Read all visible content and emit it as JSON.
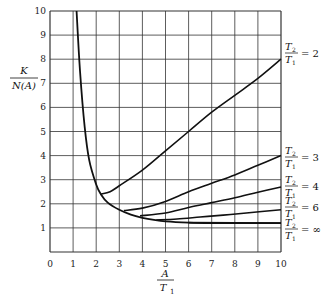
{
  "chart_data": {
    "type": "line",
    "title": "",
    "xlabel": "A / T1",
    "ylabel": "K / N(A)",
    "xlim": [
      0,
      10
    ],
    "ylim": [
      0,
      10
    ],
    "grid": true,
    "xticks": [
      "0",
      "1",
      "2",
      "3",
      "4",
      "5",
      "6",
      "7",
      "8",
      "9",
      "10"
    ],
    "yticks": [
      "1",
      "2",
      "3",
      "4",
      "5",
      "6",
      "7",
      "8",
      "9",
      "10"
    ],
    "legend_position": "right, inline labels at curve ends",
    "envelope": {
      "name": "T2/T1 = inf envelope (steep branch)",
      "x": [
        1.15,
        1.3,
        1.5,
        1.7,
        2.0,
        2.2,
        2.5,
        3.0,
        3.5,
        4.0,
        4.5,
        5.0,
        6.0,
        7.0,
        8.0,
        9.0,
        10.0
      ],
      "y": [
        10.0,
        7.5,
        5.2,
        3.8,
        2.8,
        2.4,
        2.05,
        1.75,
        1.55,
        1.42,
        1.33,
        1.27,
        1.22,
        1.2,
        1.2,
        1.2,
        1.2
      ]
    },
    "series": [
      {
        "name": "T2/T1 = 2",
        "label_num": "T",
        "label_sub_num": "2",
        "label_den": "T",
        "label_sub_den": "1",
        "label_value": "= 2",
        "x": [
          2.2,
          2.6,
          3.0,
          4.0,
          5.0,
          6.0,
          7.0,
          8.0,
          9.0,
          10.0
        ],
        "y": [
          2.4,
          2.5,
          2.75,
          3.4,
          4.2,
          5.0,
          5.8,
          6.5,
          7.2,
          8.0
        ]
      },
      {
        "name": "T2/T1 = 3",
        "label_value": "= 3",
        "x": [
          3.2,
          4.0,
          5.0,
          6.0,
          7.0,
          8.0,
          9.0,
          10.0
        ],
        "y": [
          1.72,
          1.82,
          2.1,
          2.5,
          2.85,
          3.2,
          3.6,
          4.0
        ]
      },
      {
        "name": "T2/T1 = 4",
        "label_value": "= 4",
        "x": [
          3.9,
          5.0,
          6.0,
          7.0,
          8.0,
          9.0,
          10.0
        ],
        "y": [
          1.5,
          1.62,
          1.85,
          2.05,
          2.25,
          2.48,
          2.7
        ]
      },
      {
        "name": "T2/T1 = 6",
        "label_value": "= 6",
        "x": [
          4.6,
          5.5,
          6.5,
          7.5,
          8.5,
          10.0
        ],
        "y": [
          1.33,
          1.37,
          1.45,
          1.53,
          1.62,
          1.75
        ]
      },
      {
        "name": "T2/T1 = inf",
        "label_value": "= ∞",
        "x": [
          6.0,
          10.0
        ],
        "y": [
          1.22,
          1.2
        ]
      }
    ]
  },
  "labels": {
    "y_num": "K",
    "y_den": "N(A)",
    "x_num": "A",
    "x_den": "T",
    "x_den_sub": "1",
    "curve_T": "T",
    "sub2": "2",
    "sub1": "1",
    "v2": "= 2",
    "v3": "= 3",
    "v4": "= 4",
    "v6": "= 6",
    "vinf": "= ∞"
  }
}
